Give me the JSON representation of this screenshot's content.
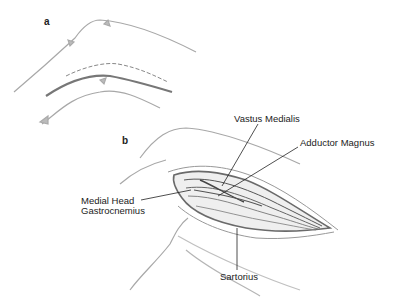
{
  "figure": {
    "panels": [
      {
        "id": "a",
        "label": "a"
      },
      {
        "id": "b",
        "label": "b"
      }
    ],
    "callouts": {
      "vastus_medialis": "Vastus Medialis",
      "adductor_magnus": "Adductor Magnus",
      "medial_head_line1": "Medial Head",
      "medial_head_line2": "Gastrocnemius",
      "sartorius": "Sartorius"
    },
    "colors": {
      "outline": "#a0a0a0",
      "incision": "#707070",
      "leader": "#222222",
      "muscle_dark": "#555555"
    }
  }
}
